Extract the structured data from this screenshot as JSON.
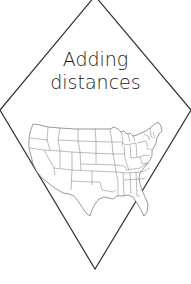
{
  "card": {
    "title_line1": "Adding",
    "title_line2": "distances",
    "illustration": "united-states-outline-map",
    "colors": {
      "background": "#ffffff",
      "stroke": "#333333",
      "text": "#1a1a1a"
    }
  }
}
